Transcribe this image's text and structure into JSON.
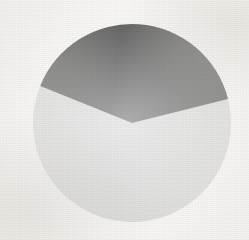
{
  "figure": {
    "background_color": "#f7f6f3",
    "media": "scanned-page"
  },
  "chart_data": {
    "type": "pie",
    "title": "",
    "subtitle": "",
    "xlabel": "",
    "ylabel": "",
    "grid": false,
    "legend_position": "none",
    "labels_shown": false,
    "categories": [
      "Slice 1",
      "Slice 2"
    ],
    "values": [
      40,
      60
    ],
    "units": "percent",
    "series": [
      {
        "name": "Share",
        "values": [
          40,
          60
        ]
      }
    ],
    "slices": [
      {
        "label": "Slice 1",
        "value": 40,
        "percent": 40,
        "angle_degrees": 144,
        "start_angle_degrees": -68,
        "end_angle_degrees": 76,
        "color": "#1f1f1f",
        "shade": "dark"
      },
      {
        "label": "Slice 2",
        "value": 60,
        "percent": 60,
        "angle_degrees": 216,
        "start_angle_degrees": 76,
        "end_angle_degrees": 292,
        "color": "#cdcdcd",
        "shade": "light-gray"
      }
    ],
    "geometry": {
      "center_x": 132,
      "center_y": 123,
      "radius": 99,
      "start_angle_from_twelve_oclock": -68,
      "direction": "clockwise"
    },
    "colors": {
      "dark_slice": "#1f1f1f",
      "light_slice": "#cdcdcd",
      "background": "#f7f6f3"
    }
  }
}
